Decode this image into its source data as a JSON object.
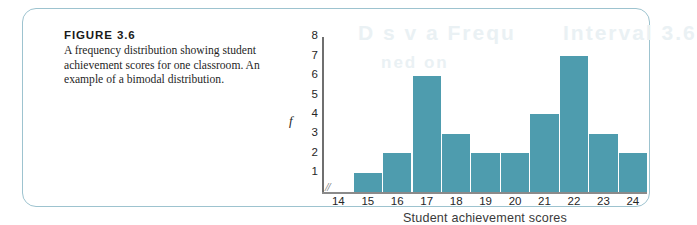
{
  "figure": {
    "label": "FIGURE 3.6",
    "caption": "A frequency distribution showing student achievement scores for one classroom. An example of a bimodal distribution."
  },
  "bleed_text": {
    "a": "D  s  v  a   Frequ",
    "b": "Interval 3.6",
    "c": "ned  on"
  },
  "chart_data": {
    "type": "bar",
    "title": "",
    "subtitle": "",
    "xlabel": "Student achievement scores",
    "ylabel": "f",
    "categories": [
      "14",
      "15",
      "16",
      "17",
      "18",
      "19",
      "20",
      "21",
      "22",
      "23",
      "24"
    ],
    "values": [
      0,
      1,
      2,
      6,
      3,
      2,
      2,
      4,
      7,
      3,
      2
    ],
    "ytick_labels": [
      "8",
      "7",
      "6",
      "5",
      "4",
      "3",
      "2",
      "1"
    ],
    "ylim": [
      0,
      8
    ],
    "grid": false,
    "legend": "none",
    "bar_color": "#4e9cae",
    "axis_break_symbol": "//",
    "axis_color": "#7c7c7c"
  }
}
